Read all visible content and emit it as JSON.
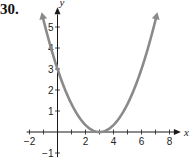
{
  "problem_number": "30.",
  "colors": {
    "curve": "#8a8a8a",
    "axis": "#1a1a1a"
  },
  "chart_data": {
    "type": "line",
    "title": "",
    "xlabel": "x",
    "ylabel": "y",
    "xlim": [
      -2.2,
      8.6
    ],
    "ylim": [
      -1.2,
      5.9
    ],
    "x_ticks": [
      -2,
      2,
      4,
      6,
      8
    ],
    "y_ticks": [
      -1,
      1,
      2,
      3,
      4,
      5
    ],
    "grid": false,
    "legend": "none",
    "series": [
      {
        "name": "parabola",
        "equation": "y = (x - 3)^2 / 3",
        "vertex": [
          3,
          0
        ],
        "y_intercept": [
          0,
          3
        ],
        "x": [
          -1,
          0,
          1,
          2,
          3,
          4,
          5,
          6,
          7
        ],
        "values": [
          5.33,
          3,
          1.33,
          0.33,
          0,
          0.33,
          1.33,
          3,
          5.33
        ],
        "arrows_at_ends": true
      }
    ]
  }
}
